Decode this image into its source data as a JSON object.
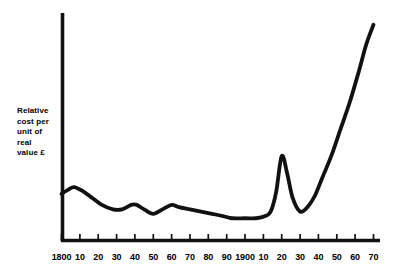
{
  "figure": {
    "background_color": "#ffffff",
    "ink_color": "#111111",
    "width": 401,
    "height": 275
  },
  "y_axis_caption": {
    "lines": [
      "Relative",
      "cost per",
      "unit of",
      "real",
      "value £"
    ],
    "text": "Relative\ncost per\nunit of\nreal\nvalue £"
  },
  "chart_data": {
    "type": "line",
    "title": "",
    "xlabel": "",
    "ylabel": "Relative cost per unit of real value £",
    "grid": false,
    "legend": null,
    "xlim": [
      1800,
      1970
    ],
    "ylim": [
      0,
      100
    ],
    "x_tick_labels": [
      "1800",
      "10",
      "20",
      "30",
      "40",
      "50",
      "60",
      "70",
      "80",
      "90",
      "1900",
      "10",
      "20",
      "30",
      "40",
      "50",
      "60",
      "70"
    ],
    "x_tick_values": [
      1800,
      1810,
      1820,
      1830,
      1840,
      1850,
      1860,
      1870,
      1880,
      1890,
      1900,
      1910,
      1920,
      1930,
      1940,
      1950,
      1960,
      1970
    ],
    "y_tick_labels": [],
    "series": [
      {
        "name": "Relative cost per unit of real value",
        "x": [
          1800,
          1804,
          1807,
          1812,
          1817,
          1822,
          1828,
          1833,
          1838,
          1841,
          1845,
          1850,
          1855,
          1860,
          1864,
          1870,
          1876,
          1882,
          1888,
          1893,
          1900,
          1906,
          1911,
          1914,
          1917,
          1920,
          1923,
          1926,
          1930,
          1934,
          1938,
          1942,
          1947,
          1952,
          1957,
          1962,
          1966,
          1970
        ],
        "values": [
          21,
          23,
          24,
          22,
          19,
          16,
          14,
          14,
          16,
          16,
          14,
          12,
          14,
          16,
          15,
          14,
          13,
          12,
          11,
          10,
          10,
          10,
          11,
          13,
          22,
          38,
          30,
          19,
          13,
          15,
          20,
          28,
          38,
          50,
          62,
          76,
          88,
          97
        ]
      }
    ],
    "annotations": []
  }
}
